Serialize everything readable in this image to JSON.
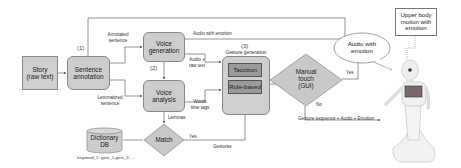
{
  "diagram": {
    "nodes": {
      "story": "Story (raw text)",
      "story_line1": "Story",
      "story_line2": "(raw text)",
      "sentence_annotation_line1": "Sentence",
      "sentence_annotation_line2": "annotation",
      "voice_generation_line1": "Voice",
      "voice_generation_line2": "generation",
      "voice_analysis_line1": "Voice",
      "voice_analysis_line2": "analysis",
      "gesture_generation": "Gesture generation",
      "tacotron": "Tacotron",
      "rule_based": "Rule-based",
      "manual_touch_line1": "Manual",
      "manual_touch_line2": "touch",
      "manual_touch_line3": "(GUI)",
      "match": "Match",
      "dictionary_line1": "Dictionary",
      "dictionary_line2": "DB",
      "dictionary_caption": "keyword_1: gest_1,gest_2, ...",
      "upper_body_line1": "Upper body",
      "upper_body_line2": "motion with",
      "upper_body_line3": "emotion",
      "bubble_line1": "Audio with",
      "bubble_line2": "emotion"
    },
    "step_numbers": {
      "step1": "(1)",
      "step2": "(2)",
      "step3": "(3)"
    },
    "edge_labels": {
      "annotated_line1": "Annotated",
      "annotated_line2": "sentence",
      "lemmatized_line1": "Lemmatized",
      "lemmatized_line2": "sentence",
      "audio_with_emotion": "Audio with emotion",
      "audio_raw_line1": "Audio +",
      "audio_raw_line2": "raw text",
      "words_line1": "Words",
      "words_line2": "time tags",
      "lemmas": "Lemmas",
      "yes_match": "Yes",
      "gestures": "Gestures",
      "yes_manual": "Yes",
      "no_manual": "No",
      "output": "Gesture sequence + Audio + Emotion"
    },
    "colors": {
      "box_fill": "#cdcdcd",
      "inner_fill": "#9a9a9a",
      "line": "#555555",
      "background": "#ffffff"
    }
  }
}
